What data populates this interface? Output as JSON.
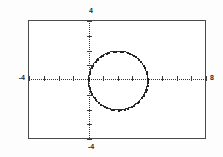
{
  "app": {
    "title": "Graphing Calculator Plot"
  },
  "chart_data": {
    "type": "scatter",
    "title": "",
    "subtitle": "",
    "xlabel": "",
    "ylabel": "",
    "grid": false,
    "legend": "none",
    "render_style": "dotted pixel trace on bordered calculator screen",
    "xlim": [
      -4,
      8
    ],
    "ylim": [
      -4,
      4
    ],
    "xtick_labels": [
      "-4",
      "8"
    ],
    "ytick_labels": [
      "-4",
      "4"
    ],
    "axes": {
      "x_axis_label_left": "-4",
      "x_axis_label_right": "8",
      "y_axis_label_top": "4",
      "y_axis_label_bottom": "-4",
      "x_axis_drawn_at_y": 0,
      "y_axis_drawn_at_x": 0,
      "tick_spacing_x": 1,
      "tick_spacing_y": 1
    },
    "annotations": [],
    "series": [
      {
        "name": "circle",
        "shape": "circle",
        "equation": "(x - 2)^2 + y^2 = 4",
        "center": [
          2,
          0
        ],
        "radius": 2,
        "x_intercepts": [
          0,
          4
        ],
        "y_intercepts": [
          0
        ],
        "top_point": [
          2,
          2
        ],
        "bottom_point": [
          2,
          -2
        ],
        "tangent_to": "y-axis at (0, 0)",
        "color": "#2e2e2e",
        "style": "dotted"
      }
    ]
  },
  "labels": {
    "y_top": "4",
    "y_bottom": "-4",
    "x_left": "-4",
    "x_right": "8"
  },
  "colors": {
    "frame": "#4a4a4a",
    "axis": "#333333",
    "curve": "#2e2e2e",
    "background": "#ffffff",
    "page_background": "#fdfdfd",
    "text": "#2b2b2b"
  }
}
